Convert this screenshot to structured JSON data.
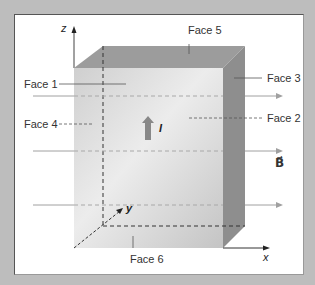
{
  "diagram": {
    "faces": [
      {
        "id": 1,
        "label": "Face 1"
      },
      {
        "id": 2,
        "label": "Face 2"
      },
      {
        "id": 3,
        "label": "Face 3"
      },
      {
        "id": 4,
        "label": "Face 4"
      },
      {
        "id": 5,
        "label": "Face 5"
      },
      {
        "id": 6,
        "label": "Face 6"
      }
    ],
    "axes": {
      "x": "x",
      "y": "y",
      "z": "z"
    },
    "current_label": "I",
    "field_label": "B⃗",
    "field_direction": "+x",
    "current_direction": "+z",
    "colors": {
      "background": "#bdbdbd",
      "panel": "#ffffff",
      "front_face": "#d6d6d6",
      "top_face": "#9a9a9a",
      "side_face": "#8c8c8c",
      "field_line": "#a8a8a8",
      "current_arrow": "#8a8a8a"
    }
  }
}
